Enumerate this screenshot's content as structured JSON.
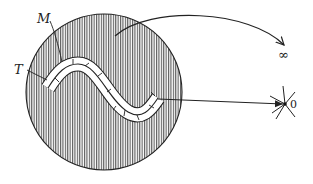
{
  "diagram": {
    "labels": {
      "manifold": "M",
      "tube": "T",
      "infinity": "∞",
      "zero": "0"
    },
    "colors": {
      "stroke": "#222222",
      "hatch": "#333333",
      "background": "#ffffff"
    },
    "elements": {
      "disk": "hatched disk region",
      "tube": "white S-shaped tubular neighborhood T around curve M",
      "arrow_to_infinity": "arrow from disk exterior region to ∞",
      "arrow_to_zero": "arrow from tube to point 0",
      "zero_point": "point 0 with radiating lines (collapsed)"
    }
  }
}
